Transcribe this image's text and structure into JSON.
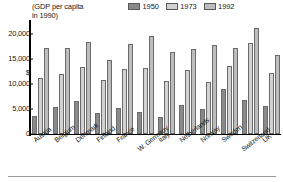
{
  "caption": {
    "line1": "(GDP per capita",
    "line2": "in 1990)"
  },
  "axis": {
    "dollar_symbol": "$",
    "yticks": [
      "20,000",
      "15,000",
      "10,000",
      "5,000",
      "0"
    ]
  },
  "colors": {
    "series_1950": "#8a8a8a",
    "series_1973": "#d2d2d2",
    "series_1992": "#bdbdbd",
    "bar_outline": "#6b6b6b",
    "axis": "#000000",
    "rule": "#9a9a9a"
  },
  "chart_data": {
    "type": "bar",
    "title": "(GDP per capita in 1990)",
    "xlabel": "",
    "ylabel": "$",
    "ylim": [
      0,
      22500
    ],
    "yticks": [
      0,
      5000,
      10000,
      15000,
      20000
    ],
    "grid": false,
    "legend_position": "top-right",
    "categories": [
      "Austria",
      "Belgium",
      "Denmark",
      "Finland",
      "France",
      "W. Germany",
      "Italy",
      "Netherlands",
      "Norway",
      "Sweden",
      "Switzerland",
      "UK"
    ],
    "series": [
      {
        "name": "1950",
        "values": [
          3700,
          5400,
          6700,
          4300,
          5300,
          4400,
          3500,
          5900,
          5100,
          9000,
          6900,
          5700
        ]
      },
      {
        "name": "1973",
        "values": [
          11200,
          12000,
          13400,
          10800,
          13000,
          13200,
          10600,
          12800,
          10400,
          13700,
          18300,
          12200
        ]
      },
      {
        "name": "1992",
        "values": [
          17200,
          17200,
          18500,
          14800,
          18100,
          19700,
          16400,
          17100,
          17800,
          17200,
          21300,
          15900
        ]
      }
    ]
  }
}
